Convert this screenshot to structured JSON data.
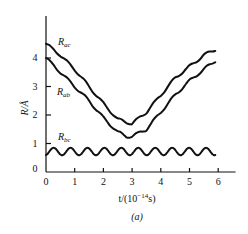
{
  "chart_data": {
    "type": "line",
    "title": "",
    "caption": "(a)",
    "xlabel": "t/(10^-14 s)",
    "xlabel_parts": {
      "prefix": "t/(10",
      "sup": "−14",
      "suffix": "s)"
    },
    "ylabel": "R/Å",
    "xlim": [
      0,
      6.5
    ],
    "ylim": [
      0,
      5.2
    ],
    "xticks": [
      "0",
      "1",
      "2",
      "3",
      "4",
      "5",
      "6"
    ],
    "yticks": [
      "0",
      "1",
      "2",
      "3",
      "4"
    ],
    "grid": false,
    "legend": "inline labels",
    "series": [
      {
        "name": "R_ac",
        "label_main": "R",
        "label_sub": "ac",
        "x": [
          0,
          0.5,
          1,
          1.5,
          2,
          2.5,
          2.8,
          3,
          3.5,
          4,
          4.5,
          5,
          5.5,
          5.9
        ],
        "values": [
          4.5,
          4.1,
          3.6,
          3.0,
          2.4,
          1.85,
          1.75,
          1.7,
          2.1,
          2.7,
          3.3,
          3.7,
          4.1,
          4.3
        ]
      },
      {
        "name": "R_ab",
        "label_main": "R",
        "label_sub": "ab",
        "x": [
          0,
          0.5,
          1,
          1.5,
          2,
          2.5,
          2.8,
          3,
          3.5,
          4,
          4.5,
          5,
          5.5,
          5.9
        ],
        "values": [
          4.0,
          3.5,
          3.0,
          2.5,
          1.9,
          1.4,
          1.25,
          1.25,
          1.5,
          2.1,
          2.7,
          3.2,
          3.6,
          3.9
        ]
      },
      {
        "name": "R_bc",
        "label_main": "R",
        "label_sub": "bc",
        "x_range": [
          0,
          5.9
        ],
        "mean": 0.72,
        "amplitude": 0.13,
        "periods": 10
      }
    ]
  }
}
